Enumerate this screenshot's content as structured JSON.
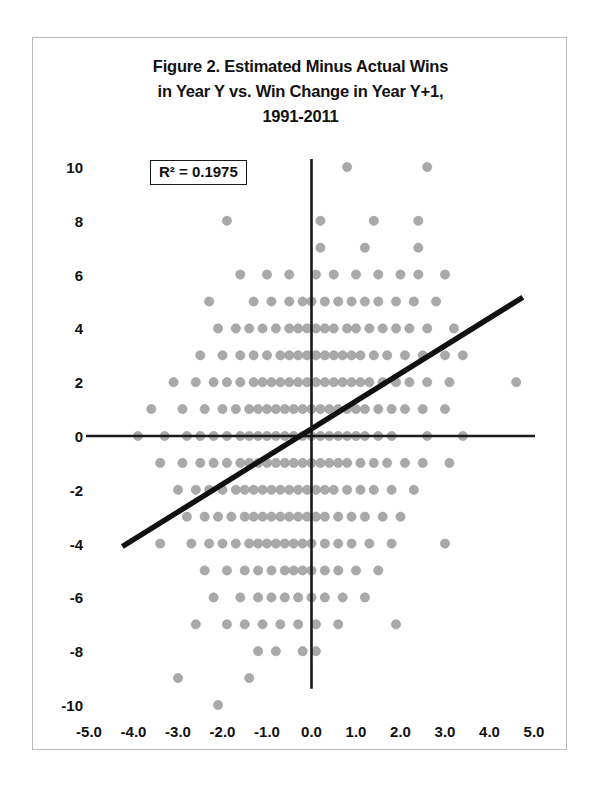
{
  "figure": {
    "title_lines": [
      "Figure 2. Estimated Minus Actual Wins",
      "in Year Y vs. Win Change in Year Y+1,",
      "1991-2011"
    ],
    "title_line1": "Figure 2. Estimated Minus Actual Wins",
    "title_line2": "in Year Y vs. Win Change in Year Y+1,",
    "title_line3": "1991-2011",
    "annotation_r2": "R² = 0.1975",
    "marker_color": "#a9a9a9",
    "trendline_color": "#111111",
    "axis_color": "#1a1a1a",
    "frame_color": "#b9b9b9"
  },
  "chart_data": {
    "type": "scatter",
    "title": "Figure 2. Estimated Minus Actual Wins in Year Y vs. Win Change in Year Y+1, 1991-2011",
    "xlabel": "",
    "ylabel": "",
    "xlim": [
      -5.0,
      5.0
    ],
    "ylim": [
      -11.0,
      11.0
    ],
    "xticks": [
      -5.0,
      -4.0,
      -3.0,
      -2.0,
      -1.0,
      0.0,
      1.0,
      2.0,
      3.0,
      4.0,
      5.0
    ],
    "xtick_labels": [
      "-5.0",
      "-4.0",
      "-3.0",
      "-2.0",
      "-1.0",
      "0.0",
      "1.0",
      "2.0",
      "3.0",
      "4.0",
      "5.0"
    ],
    "yticks": [
      10,
      8,
      6,
      4,
      2,
      0,
      -2,
      -4,
      -6,
      -8,
      -10
    ],
    "ytick_labels": [
      "10",
      "8",
      "6",
      "4",
      "2",
      "0",
      "-2",
      "-4",
      "-6",
      "-8",
      "-10"
    ],
    "grid": false,
    "legend": null,
    "annotations": [
      {
        "text": "R² = 0.1975",
        "x": -3.45,
        "y": 9.8,
        "boxed": true
      }
    ],
    "zero_lines": {
      "horizontal_y": 0,
      "vertical_x": 0.0
    },
    "trendline": {
      "type": "linear",
      "r_squared": 0.1975,
      "slope": 1.03,
      "intercept": 0.27,
      "x_start": -4.25,
      "y_start": -4.11,
      "x_end": 4.75,
      "y_end": 5.16
    },
    "series": [
      {
        "name": "Teams",
        "points": [
          [
            0.8,
            10
          ],
          [
            2.6,
            10
          ],
          [
            -1.9,
            8
          ],
          [
            0.2,
            8
          ],
          [
            1.4,
            8
          ],
          [
            2.4,
            8
          ],
          [
            0.2,
            7
          ],
          [
            1.2,
            7
          ],
          [
            2.4,
            7
          ],
          [
            -1.6,
            6
          ],
          [
            -1.0,
            6
          ],
          [
            -0.5,
            6
          ],
          [
            0.1,
            6
          ],
          [
            0.5,
            6
          ],
          [
            1.0,
            6
          ],
          [
            1.5,
            6
          ],
          [
            2.0,
            6
          ],
          [
            2.4,
            6
          ],
          [
            3.0,
            6
          ],
          [
            -2.3,
            5
          ],
          [
            -1.3,
            5
          ],
          [
            -0.9,
            5
          ],
          [
            -0.5,
            5
          ],
          [
            -0.2,
            5
          ],
          [
            0.0,
            5
          ],
          [
            0.3,
            5
          ],
          [
            0.6,
            5
          ],
          [
            0.9,
            5
          ],
          [
            1.2,
            5
          ],
          [
            1.5,
            5
          ],
          [
            1.9,
            5
          ],
          [
            2.3,
            5
          ],
          [
            2.8,
            5
          ],
          [
            -2.1,
            4
          ],
          [
            -1.7,
            4
          ],
          [
            -1.4,
            4
          ],
          [
            -1.1,
            4
          ],
          [
            -0.8,
            4
          ],
          [
            -0.5,
            4
          ],
          [
            -0.3,
            4
          ],
          [
            -0.1,
            4
          ],
          [
            0.1,
            4
          ],
          [
            0.3,
            4
          ],
          [
            0.5,
            4
          ],
          [
            0.8,
            4
          ],
          [
            1.0,
            4
          ],
          [
            1.3,
            4
          ],
          [
            1.6,
            4
          ],
          [
            1.9,
            4
          ],
          [
            2.2,
            4
          ],
          [
            2.6,
            4
          ],
          [
            3.2,
            4
          ],
          [
            -2.5,
            3
          ],
          [
            -2.0,
            3
          ],
          [
            -1.6,
            3
          ],
          [
            -1.3,
            3
          ],
          [
            -1.0,
            3
          ],
          [
            -0.7,
            3
          ],
          [
            -0.5,
            3
          ],
          [
            -0.3,
            3
          ],
          [
            -0.1,
            3
          ],
          [
            0.1,
            3
          ],
          [
            0.3,
            3
          ],
          [
            0.5,
            3
          ],
          [
            0.7,
            3
          ],
          [
            0.9,
            3
          ],
          [
            1.1,
            3
          ],
          [
            1.4,
            3
          ],
          [
            1.7,
            3
          ],
          [
            2.1,
            3
          ],
          [
            2.5,
            3
          ],
          [
            3.0,
            3
          ],
          [
            3.4,
            3
          ],
          [
            -3.1,
            2
          ],
          [
            -2.6,
            2
          ],
          [
            -2.2,
            2
          ],
          [
            -1.9,
            2
          ],
          [
            -1.6,
            2
          ],
          [
            -1.3,
            2
          ],
          [
            -1.1,
            2
          ],
          [
            -0.9,
            2
          ],
          [
            -0.7,
            2
          ],
          [
            -0.5,
            2
          ],
          [
            -0.3,
            2
          ],
          [
            -0.1,
            2
          ],
          [
            0.1,
            2
          ],
          [
            0.3,
            2
          ],
          [
            0.5,
            2
          ],
          [
            0.7,
            2
          ],
          [
            0.9,
            2
          ],
          [
            1.1,
            2
          ],
          [
            1.3,
            2
          ],
          [
            1.6,
            2
          ],
          [
            1.9,
            2
          ],
          [
            2.2,
            2
          ],
          [
            2.6,
            2
          ],
          [
            3.1,
            2
          ],
          [
            4.6,
            2
          ],
          [
            -3.6,
            1
          ],
          [
            -2.9,
            1
          ],
          [
            -2.4,
            1
          ],
          [
            -2.0,
            1
          ],
          [
            -1.7,
            1
          ],
          [
            -1.4,
            1
          ],
          [
            -1.2,
            1
          ],
          [
            -1.0,
            1
          ],
          [
            -0.8,
            1
          ],
          [
            -0.6,
            1
          ],
          [
            -0.4,
            1
          ],
          [
            -0.2,
            1
          ],
          [
            0.0,
            1
          ],
          [
            0.2,
            1
          ],
          [
            0.4,
            1
          ],
          [
            0.6,
            1
          ],
          [
            0.8,
            1
          ],
          [
            1.0,
            1
          ],
          [
            1.2,
            1
          ],
          [
            1.5,
            1
          ],
          [
            1.8,
            1
          ],
          [
            2.1,
            1
          ],
          [
            2.5,
            1
          ],
          [
            3.0,
            1
          ],
          [
            -3.9,
            0
          ],
          [
            -3.3,
            0
          ],
          [
            -2.8,
            0
          ],
          [
            -2.5,
            0
          ],
          [
            -2.2,
            0
          ],
          [
            -1.9,
            0
          ],
          [
            -1.6,
            0
          ],
          [
            -1.4,
            0
          ],
          [
            -1.2,
            0
          ],
          [
            -1.0,
            0
          ],
          [
            -0.8,
            0
          ],
          [
            -0.6,
            0
          ],
          [
            -0.4,
            0
          ],
          [
            -0.2,
            0
          ],
          [
            0.0,
            0
          ],
          [
            0.2,
            0
          ],
          [
            0.4,
            0
          ],
          [
            0.6,
            0
          ],
          [
            0.8,
            0
          ],
          [
            1.0,
            0
          ],
          [
            1.2,
            0
          ],
          [
            1.5,
            0
          ],
          [
            1.8,
            0
          ],
          [
            2.6,
            0
          ],
          [
            3.4,
            0
          ],
          [
            -3.4,
            -1
          ],
          [
            -2.9,
            -1
          ],
          [
            -2.5,
            -1
          ],
          [
            -2.2,
            -1
          ],
          [
            -1.9,
            -1
          ],
          [
            -1.6,
            -1
          ],
          [
            -1.4,
            -1
          ],
          [
            -1.2,
            -1
          ],
          [
            -1.0,
            -1
          ],
          [
            -0.8,
            -1
          ],
          [
            -0.6,
            -1
          ],
          [
            -0.4,
            -1
          ],
          [
            -0.2,
            -1
          ],
          [
            0.0,
            -1
          ],
          [
            0.2,
            -1
          ],
          [
            0.4,
            -1
          ],
          [
            0.6,
            -1
          ],
          [
            0.8,
            -1
          ],
          [
            1.1,
            -1
          ],
          [
            1.4,
            -1
          ],
          [
            1.7,
            -1
          ],
          [
            2.1,
            -1
          ],
          [
            2.5,
            -1
          ],
          [
            3.1,
            -1
          ],
          [
            -3.0,
            -2
          ],
          [
            -2.6,
            -2
          ],
          [
            -2.3,
            -2
          ],
          [
            -2.0,
            -2
          ],
          [
            -1.7,
            -2
          ],
          [
            -1.5,
            -2
          ],
          [
            -1.3,
            -2
          ],
          [
            -1.1,
            -2
          ],
          [
            -0.9,
            -2
          ],
          [
            -0.7,
            -2
          ],
          [
            -0.5,
            -2
          ],
          [
            -0.3,
            -2
          ],
          [
            -0.1,
            -2
          ],
          [
            0.1,
            -2
          ],
          [
            0.3,
            -2
          ],
          [
            0.5,
            -2
          ],
          [
            0.8,
            -2
          ],
          [
            1.1,
            -2
          ],
          [
            1.4,
            -2
          ],
          [
            1.8,
            -2
          ],
          [
            2.3,
            -2
          ],
          [
            -2.8,
            -3
          ],
          [
            -2.4,
            -3
          ],
          [
            -2.1,
            -3
          ],
          [
            -1.8,
            -3
          ],
          [
            -1.5,
            -3
          ],
          [
            -1.3,
            -3
          ],
          [
            -1.1,
            -3
          ],
          [
            -0.9,
            -3
          ],
          [
            -0.7,
            -3
          ],
          [
            -0.5,
            -3
          ],
          [
            -0.3,
            -3
          ],
          [
            -0.1,
            -3
          ],
          [
            0.1,
            -3
          ],
          [
            0.3,
            -3
          ],
          [
            0.6,
            -3
          ],
          [
            0.9,
            -3
          ],
          [
            1.2,
            -3
          ],
          [
            1.6,
            -3
          ],
          [
            2.0,
            -3
          ],
          [
            -3.4,
            -4
          ],
          [
            -2.7,
            -4
          ],
          [
            -2.3,
            -4
          ],
          [
            -2.0,
            -4
          ],
          [
            -1.7,
            -4
          ],
          [
            -1.4,
            -4
          ],
          [
            -1.2,
            -4
          ],
          [
            -1.0,
            -4
          ],
          [
            -0.8,
            -4
          ],
          [
            -0.6,
            -4
          ],
          [
            -0.4,
            -4
          ],
          [
            -0.2,
            -4
          ],
          [
            0.0,
            -4
          ],
          [
            0.3,
            -4
          ],
          [
            0.6,
            -4
          ],
          [
            0.9,
            -4
          ],
          [
            1.3,
            -4
          ],
          [
            1.8,
            -4
          ],
          [
            3.0,
            -4
          ],
          [
            -2.4,
            -5
          ],
          [
            -1.9,
            -5
          ],
          [
            -1.5,
            -5
          ],
          [
            -1.2,
            -5
          ],
          [
            -0.9,
            -5
          ],
          [
            -0.6,
            -5
          ],
          [
            -0.4,
            -5
          ],
          [
            -0.2,
            -5
          ],
          [
            0.0,
            -5
          ],
          [
            0.3,
            -5
          ],
          [
            0.6,
            -5
          ],
          [
            1.0,
            -5
          ],
          [
            1.5,
            -5
          ],
          [
            -2.2,
            -6
          ],
          [
            -1.6,
            -6
          ],
          [
            -1.2,
            -6
          ],
          [
            -0.9,
            -6
          ],
          [
            -0.6,
            -6
          ],
          [
            -0.3,
            -6
          ],
          [
            0.0,
            -6
          ],
          [
            0.3,
            -6
          ],
          [
            0.7,
            -6
          ],
          [
            1.2,
            -6
          ],
          [
            -2.6,
            -7
          ],
          [
            -1.9,
            -7
          ],
          [
            -1.5,
            -7
          ],
          [
            -1.1,
            -7
          ],
          [
            -0.7,
            -7
          ],
          [
            -0.3,
            -7
          ],
          [
            0.1,
            -7
          ],
          [
            0.6,
            -7
          ],
          [
            1.9,
            -7
          ],
          [
            -1.2,
            -8
          ],
          [
            -0.8,
            -8
          ],
          [
            -0.2,
            -8
          ],
          [
            0.1,
            -8
          ],
          [
            -3.0,
            -9
          ],
          [
            -1.4,
            -9
          ],
          [
            -2.1,
            -10
          ]
        ]
      }
    ]
  }
}
